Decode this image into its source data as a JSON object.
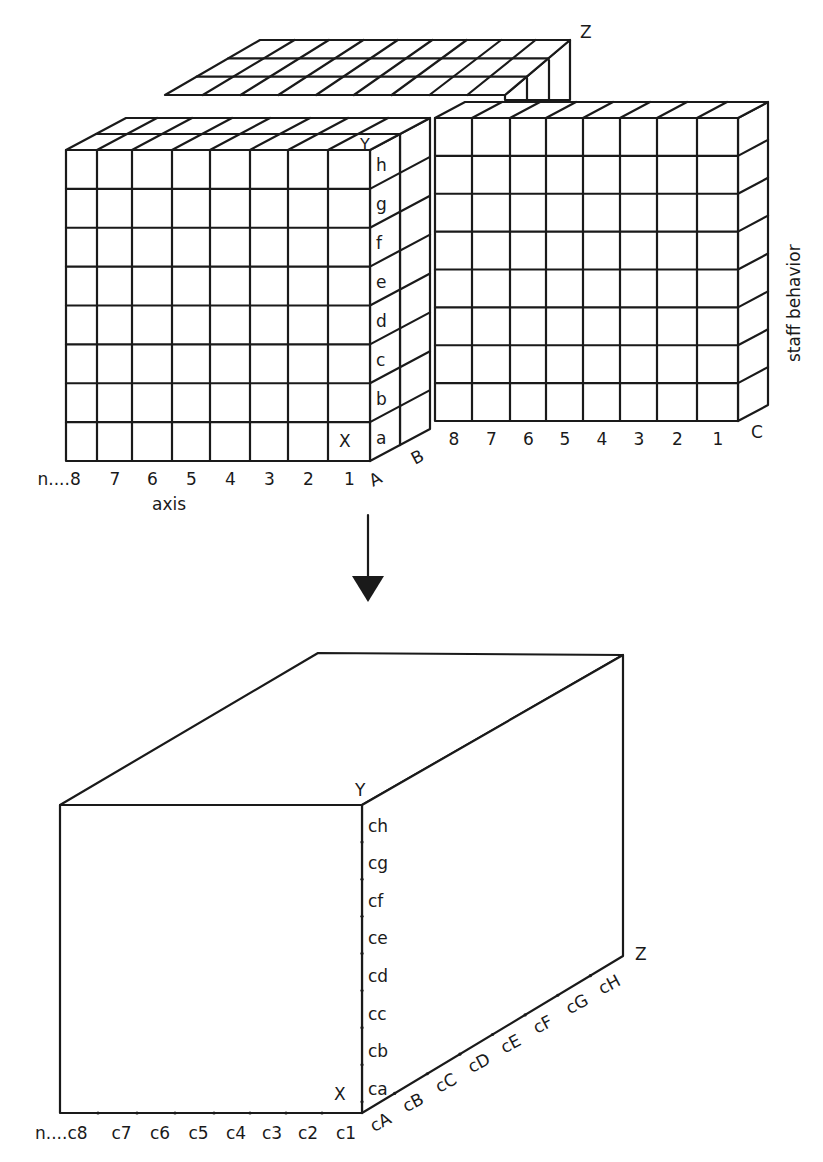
{
  "diagram": {
    "top_figure": {
      "name": "multidimensional-grid-model",
      "axis_corner_labels": {
        "y": "Y",
        "z": "Z",
        "x": "X"
      },
      "x_axis_ticks": [
        "n....8",
        "7",
        "6",
        "5",
        "4",
        "3",
        "2",
        "1"
      ],
      "x_axis_title": "axis",
      "y_axis_ticks": [
        "h",
        "g",
        "f",
        "e",
        "d",
        "c",
        "b",
        "a"
      ],
      "depth_labels": [
        "A",
        "B",
        "C"
      ],
      "right_block_ticks": [
        "8",
        "7",
        "6",
        "5",
        "4",
        "3",
        "2",
        "1"
      ],
      "right_side_title": "staff behavior"
    },
    "arrow": {
      "direction": "down",
      "meaning": "transforms-to"
    },
    "bottom_figure": {
      "name": "combined-cube-model",
      "axis_corner_labels": {
        "y": "Y",
        "z": "Z",
        "x": "X"
      },
      "x_axis_ticks": [
        "n....c8",
        "c7",
        "c6",
        "c5",
        "c4",
        "c3",
        "c2",
        "c1"
      ],
      "y_axis_ticks": [
        "ch",
        "cg",
        "cf",
        "ce",
        "cd",
        "cc",
        "cb",
        "ca"
      ],
      "z_axis_ticks": [
        "cA",
        "cB",
        "cC",
        "cD",
        "cE",
        "cF",
        "cG",
        "cH"
      ]
    }
  }
}
